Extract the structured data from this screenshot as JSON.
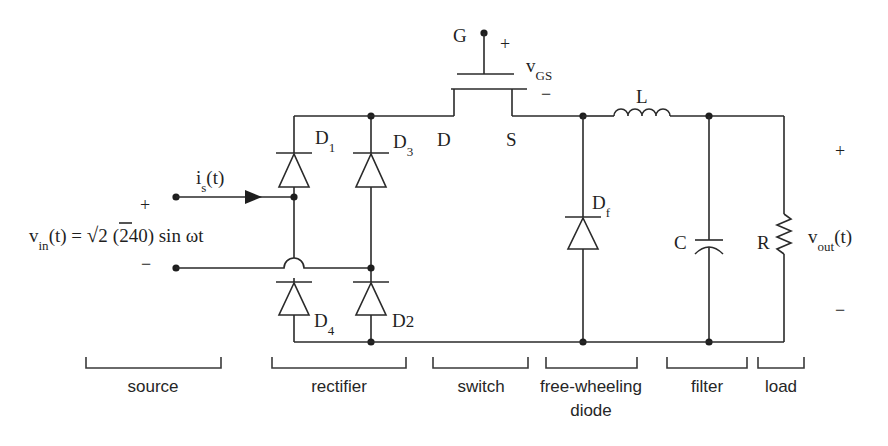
{
  "source": {
    "voltage_label": "v",
    "voltage_sub": "in",
    "voltage_expr_pre": "(t) = ",
    "sqrt_symbol": "√",
    "sqrt_arg": "2",
    "voltage_expr_post": "(240) sin ωt",
    "plus": "+",
    "minus": "−",
    "current_label": "i",
    "current_sub": "s",
    "current_suffix": "(t)"
  },
  "rectifier": {
    "diodes": [
      {
        "name": "D",
        "sub": "1"
      },
      {
        "name": "D",
        "sub": "3"
      },
      {
        "name": "D",
        "sub": "4"
      },
      {
        "name": "D",
        "sub": "2"
      }
    ]
  },
  "switch": {
    "gate": "G",
    "drain": "D",
    "source": "S",
    "vgs_label": "v",
    "vgs_sub": "GS",
    "plus": "+",
    "minus": "−"
  },
  "freewheel": {
    "name": "D",
    "sub": "f"
  },
  "filter": {
    "inductor": "L",
    "capacitor": "C"
  },
  "load": {
    "resistor": "R",
    "vout_label": "v",
    "vout_sub": "out",
    "vout_suffix": "(t)",
    "plus": "+",
    "minus": "−"
  },
  "sections": [
    {
      "label": "source"
    },
    {
      "label": "rectifier"
    },
    {
      "label": "switch"
    },
    {
      "label": "free-wheeling",
      "label2": "diode"
    },
    {
      "label": "filter"
    },
    {
      "label": "load"
    }
  ]
}
